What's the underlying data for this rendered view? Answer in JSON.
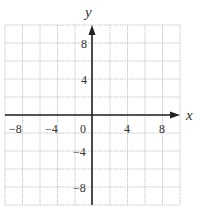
{
  "diagram": {
    "type": "coordinate-grid",
    "x_axis_label": "x",
    "y_axis_label": "y",
    "x_range": [
      -10,
      10
    ],
    "y_range": [
      -10,
      10
    ],
    "grid_spacing": 2,
    "x_tick_labels": [
      "−8",
      "−4",
      "0",
      "4",
      "8"
    ],
    "y_tick_labels": [
      "8",
      "4",
      "−4",
      "−8"
    ],
    "colors": {
      "grid": "#c8c8c8",
      "axis": "#222222",
      "text": "#333333"
    }
  }
}
